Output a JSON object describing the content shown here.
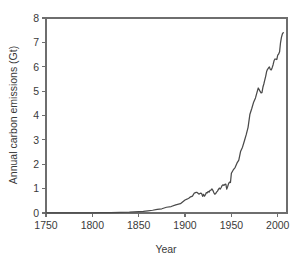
{
  "chart_data": {
    "type": "line",
    "title": "",
    "xlabel": "Year",
    "ylabel": "Annual carbon emissions (Gt)",
    "xlim": [
      1750,
      2010
    ],
    "ylim": [
      0,
      8
    ],
    "xticks": [
      "1750",
      "1800",
      "1850",
      "1900",
      "1950",
      "2000"
    ],
    "xtick_values": [
      1750,
      1800,
      1850,
      1900,
      1950,
      2000
    ],
    "yticks": [
      "0",
      "1",
      "2",
      "3",
      "4",
      "5",
      "6",
      "7",
      "8"
    ],
    "ytick_values": [
      0,
      1,
      2,
      3,
      4,
      5,
      6,
      7,
      8
    ],
    "grid": false,
    "legend": null,
    "line_color": "#4a4a4a",
    "axis_color": "#6e6e6e",
    "background_color": "#ffffff",
    "series": [
      {
        "name": "Annual carbon emissions",
        "units": "Gt",
        "x": [
          1750,
          1760,
          1770,
          1780,
          1790,
          1800,
          1810,
          1820,
          1830,
          1840,
          1850,
          1855,
          1860,
          1865,
          1870,
          1875,
          1880,
          1885,
          1890,
          1895,
          1900,
          1902,
          1904,
          1906,
          1908,
          1910,
          1912,
          1913,
          1914,
          1915,
          1916,
          1917,
          1918,
          1919,
          1920,
          1921,
          1922,
          1923,
          1924,
          1925,
          1926,
          1927,
          1928,
          1929,
          1930,
          1931,
          1932,
          1933,
          1934,
          1935,
          1936,
          1937,
          1938,
          1939,
          1940,
          1941,
          1942,
          1943,
          1944,
          1945,
          1946,
          1947,
          1948,
          1949,
          1950,
          1952,
          1954,
          1956,
          1958,
          1960,
          1962,
          1964,
          1966,
          1968,
          1970,
          1972,
          1974,
          1976,
          1978,
          1979,
          1980,
          1981,
          1982,
          1983,
          1984,
          1985,
          1986,
          1987,
          1988,
          1989,
          1990,
          1991,
          1992,
          1993,
          1994,
          1995,
          1996,
          1997,
          1998,
          1999,
          2000,
          2001,
          2002,
          2003,
          2004,
          2005,
          2006
        ],
        "y": [
          0.003,
          0.004,
          0.005,
          0.006,
          0.008,
          0.01,
          0.013,
          0.017,
          0.023,
          0.031,
          0.054,
          0.064,
          0.091,
          0.113,
          0.147,
          0.174,
          0.236,
          0.266,
          0.336,
          0.381,
          0.534,
          0.566,
          0.604,
          0.663,
          0.691,
          0.819,
          0.843,
          0.843,
          0.809,
          0.773,
          0.8,
          0.815,
          0.789,
          0.681,
          0.765,
          0.69,
          0.749,
          0.836,
          0.828,
          0.884,
          0.858,
          0.93,
          0.936,
          0.986,
          0.93,
          0.843,
          0.771,
          0.795,
          0.855,
          0.899,
          0.967,
          1.024,
          0.984,
          1.048,
          1.128,
          1.158,
          1.133,
          1.177,
          1.187,
          0.98,
          1.085,
          1.205,
          1.269,
          1.25,
          1.63,
          1.767,
          1.865,
          2.044,
          2.166,
          2.535,
          2.7,
          2.955,
          3.213,
          3.513,
          4.053,
          4.286,
          4.546,
          4.722,
          4.999,
          5.128,
          5.06,
          4.988,
          4.93,
          4.937,
          5.158,
          5.292,
          5.45,
          5.608,
          5.804,
          5.897,
          5.948,
          5.991,
          5.892,
          5.87,
          5.963,
          6.084,
          6.245,
          6.318,
          6.314,
          6.297,
          6.48,
          6.522,
          6.612,
          6.983,
          7.205,
          7.345,
          7.4
        ]
      }
    ]
  }
}
